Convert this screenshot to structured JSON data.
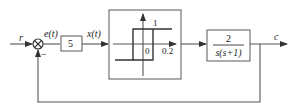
{
  "diagram": {
    "type": "control-system-block-diagram",
    "signals": {
      "input": "r",
      "error": "e(t)",
      "gain_output": "x(t)",
      "output": "c"
    },
    "summing_junction": {
      "feedback_sign": "−"
    },
    "blocks": {
      "gain": {
        "value": "5"
      },
      "relay": {
        "description": "relay with hysteresis",
        "output_level": "1",
        "origin_label": "0",
        "hysteresis_label": "0.2"
      },
      "plant": {
        "numerator": "2",
        "denominator": "s(s+1)"
      }
    },
    "feedback": "unity negative feedback"
  }
}
